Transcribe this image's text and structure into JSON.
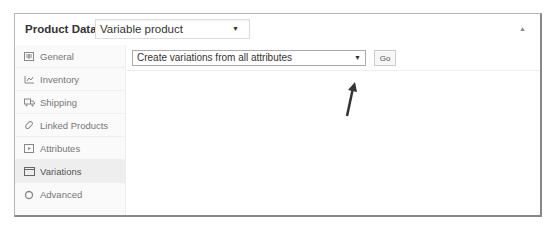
{
  "header": {
    "title": "Product Data —",
    "product_type": "Variable product",
    "collapse_icon": "triangle-up"
  },
  "sidebar": {
    "items": [
      {
        "label": "General",
        "icon": "grid-icon",
        "active": false
      },
      {
        "label": "Inventory",
        "icon": "inventory-icon",
        "active": false
      },
      {
        "label": "Shipping",
        "icon": "truck-icon",
        "active": false
      },
      {
        "label": "Linked Products",
        "icon": "link-icon",
        "active": false
      },
      {
        "label": "Attributes",
        "icon": "attributes-icon",
        "active": false
      },
      {
        "label": "Variations",
        "icon": "window-icon",
        "active": true
      },
      {
        "label": "Advanced",
        "icon": "gear-icon",
        "active": false
      }
    ]
  },
  "main": {
    "variation_action": "Create variations from all attributes",
    "go_label": "Go"
  },
  "annotation": {
    "arrow_color": "#333333"
  }
}
